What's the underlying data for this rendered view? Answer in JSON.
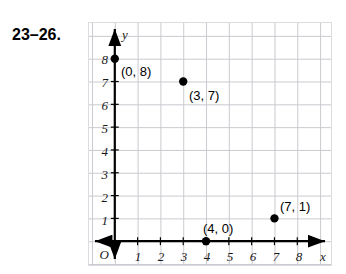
{
  "exercise": {
    "number": "23–26."
  },
  "graph": {
    "origin_label": "O",
    "x_axis_name": "x",
    "y_axis_name": "y",
    "x_ticks": [
      "1",
      "2",
      "3",
      "4",
      "5",
      "6",
      "7",
      "8"
    ],
    "y_ticks": [
      "1",
      "2",
      "3",
      "4",
      "5",
      "6",
      "7",
      "8"
    ],
    "grid_color": "#c9c9cf",
    "axis_color": "#000000",
    "point_color": "#000000"
  },
  "chart_data": {
    "type": "scatter",
    "title": "",
    "xlabel": "x",
    "ylabel": "y",
    "xlim": [
      0,
      9
    ],
    "ylim": [
      0,
      9
    ],
    "xticks": [
      1,
      2,
      3,
      4,
      5,
      6,
      7,
      8
    ],
    "yticks": [
      1,
      2,
      3,
      4,
      5,
      6,
      7,
      8
    ],
    "grid": true,
    "legend": "none",
    "points": [
      {
        "x": 0,
        "y": 8,
        "label": "(0, 8)",
        "label_dx": 6,
        "label_dy": 6
      },
      {
        "x": 3,
        "y": 7,
        "label": "(3, 7)",
        "label_dx": 5,
        "label_dy": 7
      },
      {
        "x": 7,
        "y": 1,
        "label": "(7, 1)",
        "label_dx": 4,
        "label_dy": -20
      },
      {
        "x": 4,
        "y": 0,
        "label": "(4, 0)",
        "label_dx": -4,
        "label_dy": -21
      }
    ]
  }
}
